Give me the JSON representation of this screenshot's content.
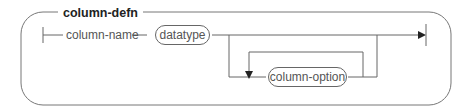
{
  "diagram": {
    "title": "column-defn",
    "nodes": {
      "column_name": "column-name",
      "datatype": "datatype",
      "column_option": "column-option"
    },
    "colors": {
      "line": "#666666",
      "text": "#555555",
      "title": "#222222"
    }
  }
}
